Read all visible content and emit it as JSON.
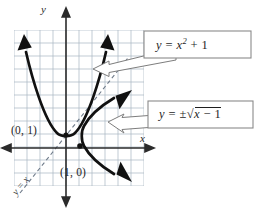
{
  "figure": {
    "background_color": "#ffffff",
    "grid_color": "#a8b4c2",
    "axis_color": "#2b2b2b",
    "curve_color": "#111111",
    "dashed_line_color": "#6f7b8a",
    "callout_border_color": "#8a8a8a",
    "callout_fill_color": "#ffffff"
  },
  "axes": {
    "x_label": "x",
    "y_label": "y",
    "x_axis_name": "horizontal-axis",
    "y_axis_name": "vertical-axis"
  },
  "grid": {
    "cell_size_px": 13,
    "columns": 10,
    "rows": 12,
    "left_px": 14,
    "top_px": 30,
    "visible": true
  },
  "points": [
    {
      "label": "(0, 1)",
      "x": 0,
      "y": 1,
      "marker": "vertex-of-parabola"
    },
    {
      "label": "(1, 0)",
      "x": 1,
      "y": 0,
      "marker": "vertex-of-sideways-parabola"
    }
  ],
  "identity_line": {
    "label": "y = x",
    "style": "dashed",
    "slope": 1,
    "intercept": 0
  },
  "callouts": [
    {
      "id": "callout-parabola",
      "text_parts": {
        "lhs": "y",
        "equals": "=",
        "base": "x",
        "exponent": "2",
        "plus": "+",
        "constant": "1"
      },
      "plain_text": "y = x² + 1",
      "points_to": "upward-parabola"
    },
    {
      "id": "callout-inverse",
      "text_parts": {
        "lhs": "y",
        "equals": "=",
        "pm": "±",
        "radical": "√",
        "radicand_var": "x",
        "minus": "−",
        "radicand_const": "1"
      },
      "plain_text": "y = ±√(x − 1)",
      "points_to": "sideways-parabola"
    }
  ],
  "curves": [
    {
      "name": "upward-parabola",
      "equation": "y = x^2 + 1",
      "vertex": [
        0,
        1
      ],
      "arrowheads": [
        "left-end",
        "right-end"
      ],
      "stroke_width": 2.6
    },
    {
      "name": "sideways-parabola",
      "equation": "y = ±sqrt(x - 1)",
      "vertex": [
        1,
        0
      ],
      "arrowheads": [
        "upper-right-end",
        "lower-right-end"
      ],
      "stroke_width": 2.6
    }
  ]
}
